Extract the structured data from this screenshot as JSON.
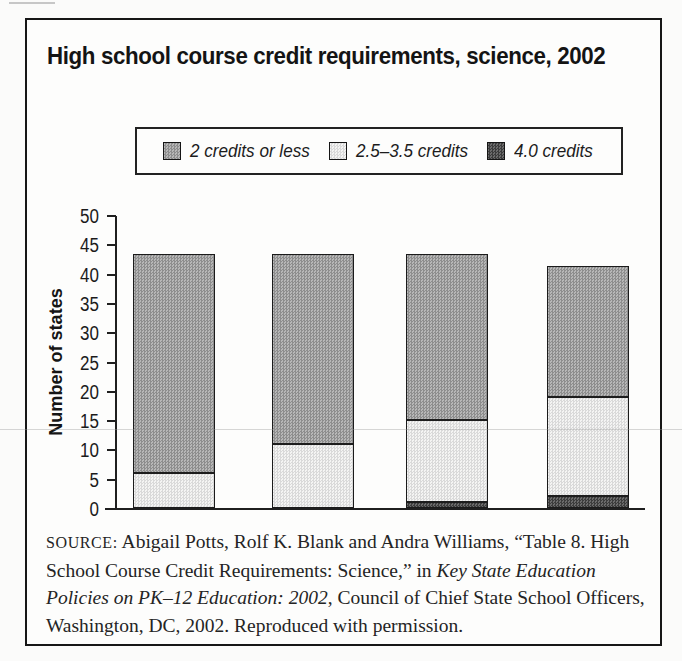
{
  "figure": {
    "title": "High school course credit requirements, science, 2002"
  },
  "legend": {
    "items": [
      {
        "label": "2 credits or less",
        "swatch": "hatch-medium",
        "approx_color": "#a2a2a2"
      },
      {
        "label": "2.5–3.5 credits",
        "swatch": "light",
        "approx_color": "#e6e6e6"
      },
      {
        "label": "4.0 credits",
        "swatch": "dark",
        "approx_color": "#4f4f4f"
      }
    ]
  },
  "chart_data": {
    "type": "bar",
    "stacked": true,
    "title": "High school course credit requirements, science, 2002",
    "categories": [
      "",
      "",
      "",
      ""
    ],
    "series": [
      {
        "name": "2 credits or less",
        "values": [
          37,
          32,
          28,
          22
        ]
      },
      {
        "name": "2.5–3.5 credits",
        "values": [
          6,
          11,
          14,
          17
        ]
      },
      {
        "name": "4.0 credits",
        "values": [
          0,
          0,
          1,
          2
        ]
      }
    ],
    "bar_totals": [
      43,
      43,
      43,
      41
    ],
    "xlabel": "",
    "ylabel": "Number of states",
    "ylim": [
      0,
      50
    ],
    "ytick_step": 5,
    "grid": false,
    "legend_position": "top",
    "x_tick_labels": []
  },
  "source": {
    "segments": [
      {
        "text": "SOURCE:",
        "style": "caps"
      },
      {
        "text": " Abigail Potts, Rolf K. Blank and Andra Williams, “Table 8. High School Course Credit Requirements: Science,” in ",
        "style": "normal"
      },
      {
        "text": "Key State Education Policies on PK–12 Education: 2002",
        "style": "italic"
      },
      {
        "text": ", Council of Chief State School Officers, Washington, DC, 2002. Reproduced with permission.",
        "style": "normal"
      }
    ]
  }
}
